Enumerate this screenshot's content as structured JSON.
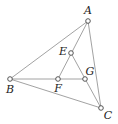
{
  "diagram": {
    "type": "geometry-figure",
    "points": [
      {
        "name": "A",
        "x": 88,
        "y": 21,
        "lx": 88,
        "ly": 14
      },
      {
        "name": "B",
        "x": 10,
        "y": 79,
        "lx": 10,
        "ly": 93
      },
      {
        "name": "C",
        "x": 101,
        "y": 108,
        "lx": 108,
        "ly": 119
      },
      {
        "name": "E",
        "x": 71,
        "y": 53,
        "lx": 63,
        "ly": 55
      },
      {
        "name": "F",
        "x": 58,
        "y": 79,
        "lx": 58,
        "ly": 92
      },
      {
        "name": "G",
        "x": 85,
        "y": 79,
        "lx": 90,
        "ly": 75
      }
    ],
    "segments": [
      [
        "A",
        "B"
      ],
      [
        "A",
        "C"
      ],
      [
        "B",
        "C"
      ],
      [
        "B",
        "G"
      ],
      [
        "A",
        "F"
      ],
      [
        "E",
        "C"
      ]
    ],
    "colors": {
      "line": "#8a8a8a",
      "point_stroke": "#444444",
      "label": "#222222"
    }
  }
}
